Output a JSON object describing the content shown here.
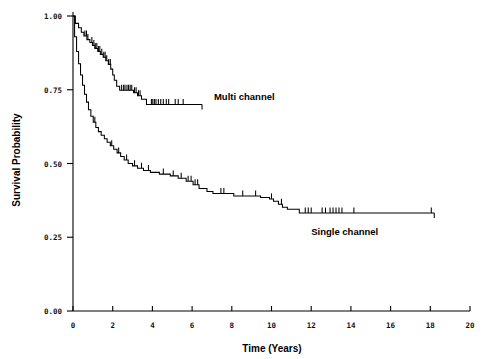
{
  "chart_data": {
    "type": "line",
    "plot_kind": "kaplan-meier-survival-curve",
    "title": "",
    "xlabel": "Time (Years)",
    "ylabel": "Survival Probability",
    "xlim": [
      0,
      20
    ],
    "ylim": [
      0.0,
      1.0
    ],
    "xticks": [
      0,
      2,
      4,
      6,
      8,
      10,
      12,
      14,
      16,
      18,
      20
    ],
    "xtick_labels": [
      "0",
      "2",
      "4",
      "6",
      "8",
      "10",
      "12",
      "14",
      "16",
      "18",
      "20"
    ],
    "yticks": [
      0.0,
      0.25,
      0.5,
      0.75,
      1.0
    ],
    "ytick_labels": [
      "0.00",
      "0.25",
      "0.50",
      "0.75",
      "1.00"
    ],
    "grid": false,
    "legend": "inline-annotations",
    "line_color": "#000000",
    "background_color": "#ffffff",
    "series": [
      {
        "name": "Multi channel",
        "label": "Multi channel",
        "label_x": 7.1,
        "label_y": 0.715,
        "end_time": 6.5,
        "final_survival": 0.7,
        "step_points": [
          [
            0.0,
            1.0
          ],
          [
            0.12,
            1.0
          ],
          [
            0.12,
            0.975
          ],
          [
            0.28,
            0.975
          ],
          [
            0.28,
            0.96
          ],
          [
            0.42,
            0.96
          ],
          [
            0.42,
            0.945
          ],
          [
            0.55,
            0.945
          ],
          [
            0.55,
            0.932
          ],
          [
            0.7,
            0.932
          ],
          [
            0.7,
            0.92
          ],
          [
            0.85,
            0.92
          ],
          [
            0.85,
            0.91
          ],
          [
            0.98,
            0.91
          ],
          [
            0.98,
            0.9
          ],
          [
            1.1,
            0.9
          ],
          [
            1.1,
            0.89
          ],
          [
            1.25,
            0.89
          ],
          [
            1.25,
            0.88
          ],
          [
            1.38,
            0.88
          ],
          [
            1.38,
            0.87
          ],
          [
            1.52,
            0.87
          ],
          [
            1.52,
            0.86
          ],
          [
            1.65,
            0.86
          ],
          [
            1.65,
            0.848
          ],
          [
            1.78,
            0.848
          ],
          [
            1.78,
            0.836
          ],
          [
            1.9,
            0.836
          ],
          [
            1.9,
            0.82
          ],
          [
            2.0,
            0.82
          ],
          [
            2.0,
            0.8
          ],
          [
            2.08,
            0.8
          ],
          [
            2.08,
            0.782
          ],
          [
            2.2,
            0.782
          ],
          [
            2.2,
            0.762
          ],
          [
            2.35,
            0.762
          ],
          [
            2.35,
            0.748
          ],
          [
            3.05,
            0.748
          ],
          [
            3.05,
            0.74
          ],
          [
            3.25,
            0.74
          ],
          [
            3.25,
            0.73
          ],
          [
            3.45,
            0.73
          ],
          [
            3.45,
            0.718
          ],
          [
            3.7,
            0.718
          ],
          [
            3.7,
            0.7
          ],
          [
            6.5,
            0.7
          ]
        ],
        "censor_times": [
          0.6,
          0.68,
          0.75,
          0.95,
          1.05,
          1.12,
          1.2,
          1.28,
          1.35,
          1.45,
          1.55,
          1.62,
          1.7,
          1.8,
          1.88,
          2.45,
          2.55,
          2.62,
          2.72,
          2.8,
          2.88,
          2.96,
          3.1,
          3.18,
          3.3,
          3.38,
          3.95,
          4.02,
          4.1,
          4.18,
          4.3,
          4.42,
          4.55,
          4.7,
          4.82,
          5.15,
          5.3,
          5.55
        ]
      },
      {
        "name": "Single channel",
        "label": "Single channel",
        "label_x": 12.0,
        "label_y": 0.258,
        "end_time": 18.2,
        "final_survival": 0.332,
        "step_points": [
          [
            0.0,
            1.0
          ],
          [
            0.08,
            1.0
          ],
          [
            0.08,
            0.93
          ],
          [
            0.18,
            0.93
          ],
          [
            0.18,
            0.88
          ],
          [
            0.28,
            0.88
          ],
          [
            0.28,
            0.838
          ],
          [
            0.38,
            0.838
          ],
          [
            0.38,
            0.8
          ],
          [
            0.48,
            0.8
          ],
          [
            0.48,
            0.765
          ],
          [
            0.58,
            0.765
          ],
          [
            0.58,
            0.735
          ],
          [
            0.68,
            0.735
          ],
          [
            0.68,
            0.708
          ],
          [
            0.78,
            0.708
          ],
          [
            0.78,
            0.682
          ],
          [
            0.9,
            0.682
          ],
          [
            0.9,
            0.66
          ],
          [
            1.02,
            0.66
          ],
          [
            1.02,
            0.64
          ],
          [
            1.15,
            0.64
          ],
          [
            1.15,
            0.622
          ],
          [
            1.28,
            0.622
          ],
          [
            1.28,
            0.608
          ],
          [
            1.42,
            0.608
          ],
          [
            1.42,
            0.596
          ],
          [
            1.58,
            0.596
          ],
          [
            1.58,
            0.584
          ],
          [
            1.72,
            0.584
          ],
          [
            1.72,
            0.572
          ],
          [
            1.88,
            0.572
          ],
          [
            1.88,
            0.56
          ],
          [
            2.05,
            0.56
          ],
          [
            2.05,
            0.548
          ],
          [
            2.22,
            0.548
          ],
          [
            2.22,
            0.536
          ],
          [
            2.4,
            0.536
          ],
          [
            2.4,
            0.524
          ],
          [
            2.58,
            0.524
          ],
          [
            2.58,
            0.512
          ],
          [
            2.78,
            0.512
          ],
          [
            2.78,
            0.5
          ],
          [
            3.0,
            0.5
          ],
          [
            3.0,
            0.492
          ],
          [
            3.25,
            0.492
          ],
          [
            3.25,
            0.484
          ],
          [
            3.55,
            0.484
          ],
          [
            3.55,
            0.476
          ],
          [
            3.9,
            0.476
          ],
          [
            3.9,
            0.47
          ],
          [
            4.35,
            0.47
          ],
          [
            4.35,
            0.464
          ],
          [
            4.9,
            0.464
          ],
          [
            4.9,
            0.458
          ],
          [
            5.3,
            0.458
          ],
          [
            5.3,
            0.45
          ],
          [
            5.7,
            0.45
          ],
          [
            5.7,
            0.44
          ],
          [
            6.05,
            0.44
          ],
          [
            6.05,
            0.428
          ],
          [
            6.35,
            0.428
          ],
          [
            6.35,
            0.415
          ],
          [
            6.75,
            0.415
          ],
          [
            6.75,
            0.405
          ],
          [
            7.05,
            0.405
          ],
          [
            7.05,
            0.398
          ],
          [
            8.1,
            0.398
          ],
          [
            8.1,
            0.39
          ],
          [
            9.45,
            0.39
          ],
          [
            9.45,
            0.385
          ],
          [
            9.9,
            0.385
          ],
          [
            9.9,
            0.38
          ],
          [
            10.1,
            0.38
          ],
          [
            10.1,
            0.372
          ],
          [
            10.35,
            0.372
          ],
          [
            10.35,
            0.362
          ],
          [
            10.55,
            0.362
          ],
          [
            10.55,
            0.352
          ],
          [
            10.8,
            0.352
          ],
          [
            10.8,
            0.345
          ],
          [
            11.4,
            0.345
          ],
          [
            11.4,
            0.332
          ],
          [
            18.2,
            0.332
          ]
        ],
        "censor_times": [
          1.1,
          1.95,
          2.3,
          2.7,
          3.1,
          3.45,
          3.8,
          4.55,
          5.05,
          5.45,
          5.8,
          5.95,
          6.15,
          6.28,
          7.45,
          7.6,
          8.55,
          9.2,
          10.0,
          10.5,
          11.7,
          11.85,
          12.0,
          12.55,
          12.72,
          12.95,
          13.1,
          13.25,
          13.4,
          13.55,
          14.15,
          18.05
        ]
      }
    ]
  },
  "axis": {
    "x_title": "Time (Years)",
    "y_title": "Survival Probability"
  }
}
